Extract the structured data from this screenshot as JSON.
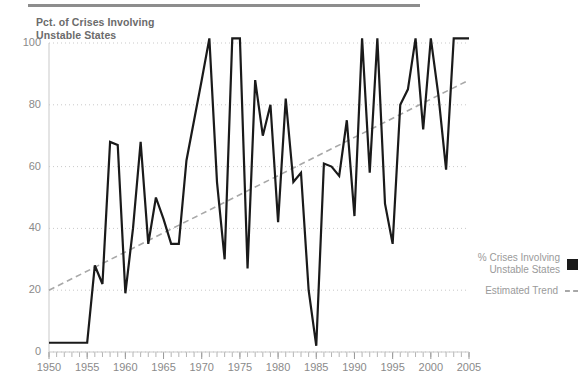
{
  "chart_data": {
    "type": "line",
    "title": "Pct. of Crises Involving Unstable States",
    "title_line1": "Pct. of Crises Involving",
    "title_line2": "Unstable States",
    "xlabel": "",
    "ylabel": "",
    "xlim": [
      1950,
      2005
    ],
    "ylim": [
      0,
      100
    ],
    "ytick_labels": [
      "0",
      "20",
      "40",
      "60",
      "80",
      "100"
    ],
    "yticks": [
      0,
      20,
      40,
      60,
      80,
      100
    ],
    "xtick_labels": [
      "1950",
      "1955",
      "1960",
      "1965",
      "1970",
      "1975",
      "1980",
      "1985",
      "1990",
      "1995",
      "2000",
      "2005"
    ],
    "xticks": [
      1950,
      1955,
      1960,
      1965,
      1970,
      1975,
      1980,
      1985,
      1990,
      1995,
      2000,
      2005
    ],
    "minor_xtick_interval": 1,
    "grid": true,
    "grid_axis": "y",
    "grid_style": "dotted",
    "legend_position": "right",
    "series": [
      {
        "name": "% Crises Involving Unstable States",
        "type": "line",
        "color": "#1a1a1a",
        "x": [
          1950,
          1951,
          1952,
          1953,
          1954,
          1955,
          1956,
          1957,
          1958,
          1959,
          1960,
          1961,
          1962,
          1963,
          1964,
          1965,
          1966,
          1967,
          1968,
          1969,
          1970,
          1971,
          1972,
          1973,
          1974,
          1975,
          1976,
          1977,
          1978,
          1979,
          1980,
          1981,
          1982,
          1983,
          1984,
          1985,
          1986,
          1987,
          1988,
          1989,
          1990,
          1991,
          1992,
          1993,
          1994,
          1995,
          1996,
          1997,
          1998,
          1999,
          2000,
          2001,
          2002,
          2003,
          2004,
          2005
        ],
        "y": [
          3,
          3,
          3,
          3,
          3,
          3,
          28,
          22,
          68,
          67,
          19,
          40,
          68,
          35,
          50,
          43,
          35,
          35,
          62,
          75,
          88,
          102,
          55,
          30,
          102,
          102,
          27,
          88,
          70,
          80,
          42,
          82,
          55,
          58,
          20,
          2,
          61,
          60,
          57,
          75,
          44,
          102,
          58,
          102,
          48,
          35,
          80,
          85,
          102,
          72,
          102,
          83,
          59,
          102,
          102,
          102
        ]
      },
      {
        "name": "Estimated Trend",
        "type": "line",
        "style": "dashed",
        "color": "#a8a8a8",
        "x": [
          1950,
          2005
        ],
        "y": [
          20,
          88
        ]
      }
    ],
    "legend": [
      {
        "label_line1": "% Crises Involving",
        "label_line2": "Unstable States",
        "marker": "square",
        "color": "#1a1a1a"
      },
      {
        "label_line1": "Estimated Trend",
        "label_line2": "",
        "marker": "dashed-line",
        "color": "#a8a8a8"
      }
    ]
  },
  "colors": {
    "series": "#1a1a1a",
    "trend": "#a8a8a8",
    "grid": "#c9c9c9",
    "text": "#8a8a8a",
    "title": "#6b6b6b",
    "rule": "#8d8d8d"
  }
}
